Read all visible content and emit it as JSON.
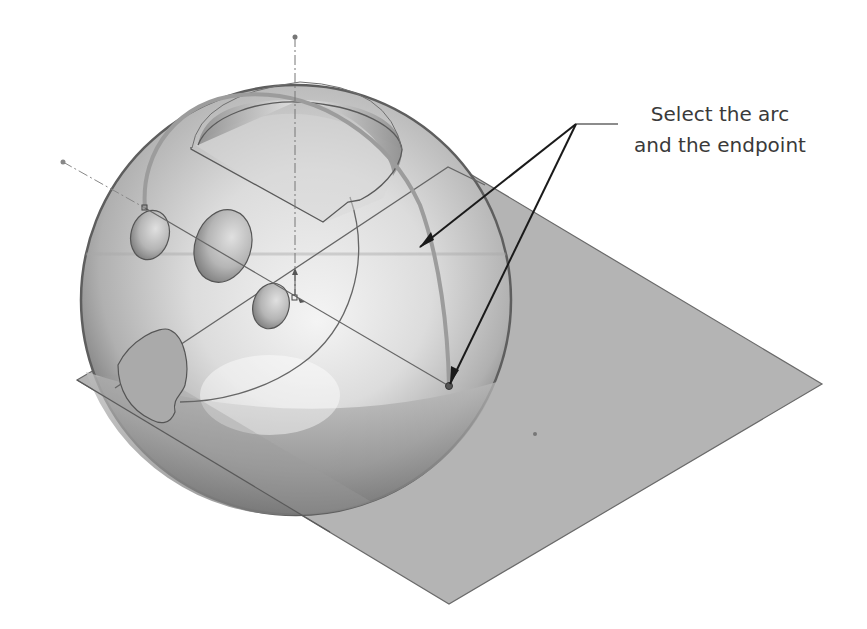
{
  "figure": {
    "callout": {
      "line1": "Select the arc",
      "line2": "and the endpoint"
    },
    "colors": {
      "background": "#ffffff",
      "sphere_light": "#f2f2f2",
      "sphere_mid": "#c6c6c6",
      "sphere_dark": "#6e6e6e",
      "plane_fill": "#b3b3b3",
      "edge": "#5a5a5a",
      "arc_highlight": "#9a9a9a",
      "leader": "#1a1a1a",
      "text": "#3a3a3a"
    },
    "elements": [
      {
        "name": "reference-plane",
        "shape": "parallelogram"
      },
      {
        "name": "sphere-body",
        "shape": "sphere"
      },
      {
        "name": "top-cut-pocket",
        "shape": "semicircular-cut"
      },
      {
        "name": "hole-left",
        "shape": "ellipse"
      },
      {
        "name": "hole-center",
        "shape": "ellipse"
      },
      {
        "name": "hole-small",
        "shape": "ellipse"
      },
      {
        "name": "hole-cone",
        "shape": "teardrop"
      },
      {
        "name": "selected-arc",
        "shape": "arc"
      },
      {
        "name": "arc-endpoint",
        "shape": "point"
      },
      {
        "name": "vertical-axis",
        "shape": "dash-dot-line"
      },
      {
        "name": "diagonal-axis",
        "shape": "dash-dot-line"
      },
      {
        "name": "origin-marker",
        "shape": "triad"
      }
    ]
  }
}
